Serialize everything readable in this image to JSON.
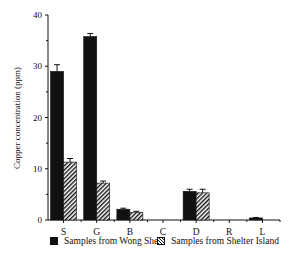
{
  "chart_data": {
    "type": "bar",
    "title": "",
    "xlabel": "",
    "ylabel": "Copper concentration (ppm)",
    "ylim": [
      0,
      40
    ],
    "yticks": [
      0,
      10,
      20,
      30,
      40
    ],
    "grid": false,
    "legend_position": "bottom",
    "categories": [
      "S",
      "G",
      "B",
      "C",
      "D",
      "R",
      "L"
    ],
    "series": [
      {
        "name": "Samples from Wong Shek",
        "fill": "solid",
        "color": "#111111",
        "values": [
          29.0,
          35.8,
          2.1,
          0,
          5.6,
          0,
          0.4
        ],
        "errors": [
          1.3,
          0.6,
          0.2,
          0,
          0.4,
          0,
          0.1
        ]
      },
      {
        "name": "Samples from Shelter Island",
        "fill": "hatched",
        "color": "#111111",
        "values": [
          11.3,
          7.2,
          1.5,
          0,
          5.3,
          0,
          0
        ],
        "errors": [
          0.7,
          0.4,
          0.2,
          0,
          0.7,
          0,
          0
        ]
      }
    ]
  },
  "legend": {
    "items": [
      {
        "label": "Samples from Wong Shek"
      },
      {
        "label": "Samples from Shelter Island"
      }
    ]
  }
}
